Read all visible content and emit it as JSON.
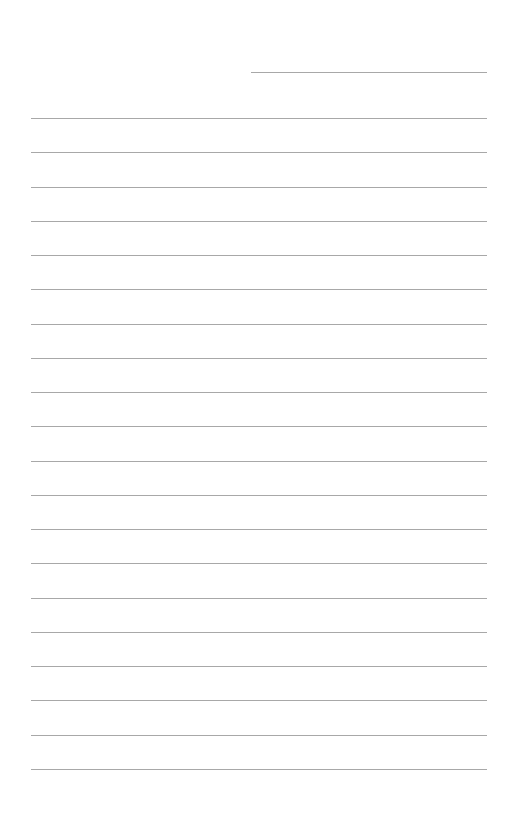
{
  "page": {
    "type": "lined-paper",
    "background_color": "#ffffff",
    "line_color": "#a8a8a8",
    "date_line": {
      "x": 251,
      "y": 72,
      "width": 236
    },
    "ruled_lines": {
      "count": 20,
      "first_y": 118,
      "spacing": 34.26,
      "x": 31,
      "width": 456
    }
  }
}
